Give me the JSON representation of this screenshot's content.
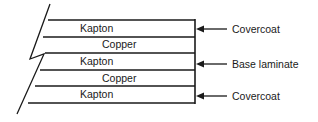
{
  "diagram": {
    "layers": [
      {
        "name": "Kapton"
      },
      {
        "name": "Copper"
      },
      {
        "name": "Kapton"
      },
      {
        "name": "Copper"
      },
      {
        "name": "Kapton"
      }
    ],
    "callouts": [
      {
        "label": "Covercoat"
      },
      {
        "label": "Base laminate"
      },
      {
        "label": "Covercoat"
      }
    ]
  }
}
